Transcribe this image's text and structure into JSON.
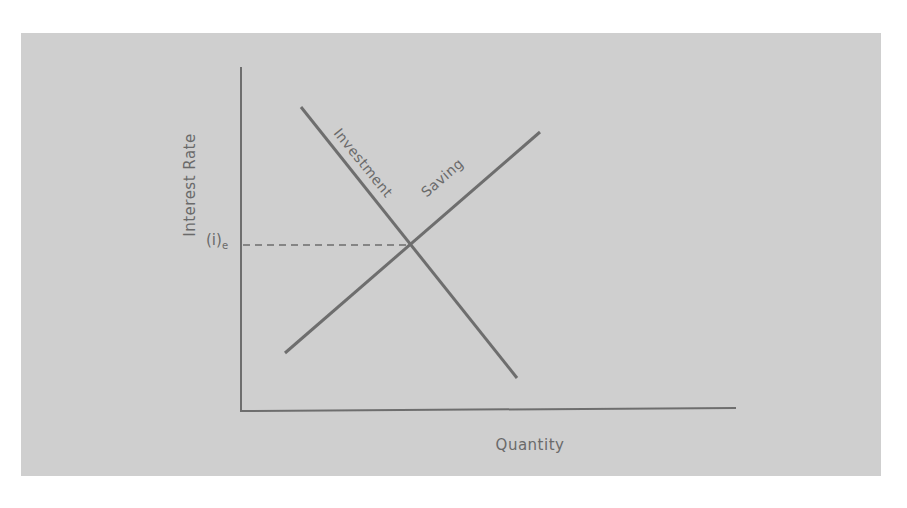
{
  "diagram": {
    "axes": {
      "y_label": "Interest Rate",
      "x_label": "Quantity"
    },
    "equilibrium": {
      "label": "(i)",
      "subscript": "e"
    },
    "curves": [
      {
        "name": "Investment",
        "slope": "downward"
      },
      {
        "name": "Saving",
        "slope": "upward"
      }
    ],
    "colors": {
      "panel": "#cfcfcf",
      "lines": "#6e6e6e",
      "text": "#6a6a6a"
    }
  }
}
